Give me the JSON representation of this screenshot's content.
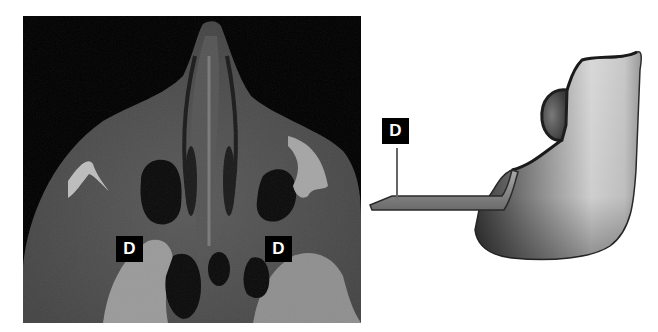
{
  "figure": {
    "left_panel": {
      "type": "axial CT scan",
      "labels": [
        {
          "text": "D",
          "position": "left"
        },
        {
          "text": "D",
          "position": "right"
        }
      ]
    },
    "right_panel": {
      "type": "3D illustration",
      "labels": [
        {
          "text": "D",
          "position": "pointer"
        }
      ]
    }
  },
  "colors": {
    "background": "#ffffff",
    "ct_background": "#000000",
    "label_bg": "#000000",
    "label_text": "#ffffff"
  }
}
